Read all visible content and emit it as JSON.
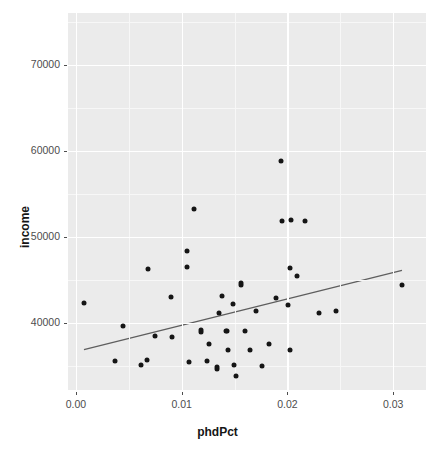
{
  "chart_data": {
    "type": "scatter",
    "title": "",
    "xlabel": "phdPct",
    "ylabel": "income",
    "xlim": [
      -0.00075,
      0.0331
    ],
    "ylim": [
      32200,
      76000
    ],
    "xticks": [
      0.0,
      0.01,
      0.02,
      0.03
    ],
    "xtick_labels": [
      "0.00",
      "0.01",
      "0.02",
      "0.03"
    ],
    "yticks": [
      40000,
      50000,
      60000,
      70000
    ],
    "ytick_labels": [
      "40000",
      "50000",
      "60000",
      "70000"
    ],
    "grid": true,
    "grid_major_color": "#ffffff",
    "grid_minor_color": "#f7f7f7",
    "panel_background": "#ebebeb",
    "point_color": "#151515",
    "point_size": 5,
    "legend": "none",
    "series": [
      {
        "name": "income vs phdPct",
        "marker": "circle",
        "points": [
          {
            "x": 0.00076,
            "y": 42300
          },
          {
            "x": 0.00445,
            "y": 39600
          },
          {
            "x": 0.0037,
            "y": 35600
          },
          {
            "x": 0.00615,
            "y": 35100
          },
          {
            "x": 0.00681,
            "y": 46200
          },
          {
            "x": 0.00672,
            "y": 35700
          },
          {
            "x": 0.00748,
            "y": 38500
          },
          {
            "x": 0.00899,
            "y": 43000
          },
          {
            "x": 0.00908,
            "y": 38400
          },
          {
            "x": 0.0105,
            "y": 46500
          },
          {
            "x": 0.01069,
            "y": 35400
          },
          {
            "x": 0.01116,
            "y": 53200
          },
          {
            "x": 0.0105,
            "y": 48400
          },
          {
            "x": 0.01182,
            "y": 39200
          },
          {
            "x": 0.01182,
            "y": 38900
          },
          {
            "x": 0.0124,
            "y": 35600
          },
          {
            "x": 0.01259,
            "y": 37600
          },
          {
            "x": 0.01354,
            "y": 41100
          },
          {
            "x": 0.01335,
            "y": 34600
          },
          {
            "x": 0.01335,
            "y": 34900
          },
          {
            "x": 0.01382,
            "y": 43100
          },
          {
            "x": 0.0143,
            "y": 39100
          },
          {
            "x": 0.0142,
            "y": 39000
          },
          {
            "x": 0.0144,
            "y": 36900
          },
          {
            "x": 0.01487,
            "y": 42200
          },
          {
            "x": 0.01496,
            "y": 35100
          },
          {
            "x": 0.01515,
            "y": 33800
          },
          {
            "x": 0.01562,
            "y": 44400
          },
          {
            "x": 0.01562,
            "y": 44600
          },
          {
            "x": 0.016,
            "y": 39100
          },
          {
            "x": 0.01647,
            "y": 36900
          },
          {
            "x": 0.01704,
            "y": 41400
          },
          {
            "x": 0.01761,
            "y": 35000
          },
          {
            "x": 0.01827,
            "y": 37500
          },
          {
            "x": 0.01894,
            "y": 42900
          },
          {
            "x": 0.01951,
            "y": 51800
          },
          {
            "x": 0.01941,
            "y": 58800
          },
          {
            "x": 0.02008,
            "y": 42100
          },
          {
            "x": 0.02027,
            "y": 46400
          },
          {
            "x": 0.02036,
            "y": 51900
          },
          {
            "x": 0.02027,
            "y": 36800
          },
          {
            "x": 0.02093,
            "y": 45400
          },
          {
            "x": 0.02169,
            "y": 51800
          },
          {
            "x": 0.02301,
            "y": 41200
          },
          {
            "x": 0.02462,
            "y": 41400
          },
          {
            "x": 0.03083,
            "y": 44400
          }
        ]
      }
    ],
    "fit_line": {
      "name": "linear-regression-line",
      "color": "#5e5e5e",
      "width": 1.2,
      "x_start": 0.00076,
      "y_start": 36900,
      "x_end": 0.03083,
      "y_end": 46100
    }
  }
}
